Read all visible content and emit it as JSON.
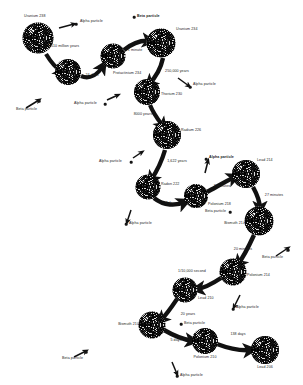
{
  "diagram": {
    "type": "decay-chain",
    "background_color": "#ffffff",
    "ink_color": "#1c1c1c",
    "nodes": [
      {
        "id": "u238",
        "label": "Uranium 238",
        "x": 38,
        "y": 38,
        "r": 15.5,
        "label_x": 24,
        "label_y": 17,
        "label_align": "left"
      },
      {
        "id": "th234",
        "label": "",
        "x": 68,
        "y": 72,
        "r": 13.0,
        "label_x": 68,
        "label_y": 72,
        "label_align": "center"
      },
      {
        "id": "pa234",
        "label": "Protactinium 234",
        "x": 113,
        "y": 56,
        "r": 12.5,
        "label_x": 113,
        "label_y": 74,
        "label_align": "left"
      },
      {
        "id": "u234",
        "label": "Uranium 234",
        "x": 161,
        "y": 43,
        "r": 14.5,
        "label_x": 176,
        "label_y": 30,
        "label_align": "left"
      },
      {
        "id": "th230",
        "label": "Thorium 230",
        "x": 147,
        "y": 92,
        "r": 13.0,
        "label_x": 161,
        "label_y": 95,
        "label_align": "left"
      },
      {
        "id": "ra226",
        "label": "Radium 226",
        "x": 167,
        "y": 135,
        "r": 14.0,
        "label_x": 181,
        "label_y": 131,
        "label_align": "left"
      },
      {
        "id": "rn222",
        "label": "Radon 222",
        "x": 148,
        "y": 187,
        "r": 12.5,
        "label_x": 161,
        "label_y": 185,
        "label_align": "left"
      },
      {
        "id": "po218",
        "label": "Polonium 218",
        "x": 196,
        "y": 196,
        "r": 12.0,
        "label_x": 208,
        "label_y": 205,
        "label_align": "left"
      },
      {
        "id": "pb214",
        "label": "Lead 214",
        "x": 246,
        "y": 174,
        "r": 14.0,
        "label_x": 257,
        "label_y": 161,
        "label_align": "left"
      },
      {
        "id": "bi214",
        "label": "Bismuth 214",
        "x": 259,
        "y": 221,
        "r": 14.5,
        "label_x": 245,
        "label_y": 224,
        "label_align": "right"
      },
      {
        "id": "po214",
        "label": "Polonium 214",
        "x": 233,
        "y": 272,
        "r": 13.5,
        "label_x": 247,
        "label_y": 276,
        "label_align": "left"
      },
      {
        "id": "pb210",
        "label": "Lead 210",
        "x": 185,
        "y": 290,
        "r": 12.5,
        "label_x": 198,
        "label_y": 299,
        "label_align": "left"
      },
      {
        "id": "bi210",
        "label": "Bismuth 210",
        "x": 152,
        "y": 325,
        "r": 13.5,
        "label_x": 139,
        "label_y": 325,
        "label_align": "right"
      },
      {
        "id": "po210",
        "label": "Polonium 210",
        "x": 205,
        "y": 341,
        "r": 13.0,
        "label_x": 205,
        "label_y": 358,
        "label_align": "center"
      },
      {
        "id": "pb206",
        "label": "Lead 206",
        "x": 265,
        "y": 350,
        "r": 14.0,
        "label_x": 265,
        "label_y": 368,
        "label_align": "center"
      }
    ],
    "decays": [
      {
        "from": "u238",
        "to": "th234",
        "half_life": "4510 million years",
        "emits": "Alpha particle",
        "time_x": 64,
        "time_y": 47
      },
      {
        "from": "th234",
        "to": "pa234",
        "half_life": "24 days",
        "emits": "Beta particle",
        "time_x": 92,
        "time_y": 76
      },
      {
        "from": "pa234",
        "to": "u234",
        "half_life": "1 minute",
        "emits": "Beta particle",
        "time_x": 135,
        "time_y": 51
      },
      {
        "from": "u234",
        "to": "th230",
        "half_life": "250,000 years",
        "emits": "Alpha particle",
        "time_x": 177,
        "time_y": 72
      },
      {
        "from": "th230",
        "to": "ra226",
        "half_life": "8000 years",
        "emits": "Alpha particle",
        "time_x": 143,
        "time_y": 115
      },
      {
        "from": "ra226",
        "to": "rn222",
        "half_life": "1,622 years",
        "emits": "Alpha particle",
        "time_x": 177,
        "time_y": 162
      },
      {
        "from": "rn222",
        "to": "po218",
        "half_life": "4 days",
        "emits": "Alpha particle",
        "time_x": 171,
        "time_y": 204
      },
      {
        "from": "po218",
        "to": "pb214",
        "half_life": "3 minutes",
        "emits": "Alpha particle",
        "time_x": 222,
        "time_y": 187
      },
      {
        "from": "pb214",
        "to": "bi214",
        "half_life": "27 minutes",
        "emits": "Beta particle",
        "time_x": 274,
        "time_y": 196
      },
      {
        "from": "bi214",
        "to": "po214",
        "half_life": "20 minutes",
        "emits": "Beta particle",
        "time_x": 243,
        "time_y": 250
      },
      {
        "from": "po214",
        "to": "pb210",
        "half_life": "1/10,000 second",
        "emits": "Alpha particle",
        "time_x": 192,
        "time_y": 272
      },
      {
        "from": "pb210",
        "to": "bi210",
        "half_life": "20 years",
        "emits": "Beta particle",
        "time_x": 188,
        "time_y": 315
      },
      {
        "from": "bi210",
        "to": "po210",
        "half_life": "5 days",
        "emits": "Beta particle",
        "time_x": 176,
        "time_y": 341
      },
      {
        "from": "po210",
        "to": "pb206",
        "half_life": "138 days",
        "emits": "Alpha particle",
        "time_x": 238,
        "time_y": 335
      }
    ],
    "emission_labels": [
      {
        "text": "Alpha particle",
        "bold": false,
        "x": 80,
        "y": 22,
        "align": "left",
        "dot_x": 76,
        "dot_y": 24,
        "tail_x1": 59,
        "tail_y1": 28,
        "tail_x2": 74,
        "tail_y2": 24
      },
      {
        "text": "Beta particle",
        "bold": true,
        "x": 137,
        "y": 17,
        "align": "left",
        "dot_x": 134,
        "dot_y": 17,
        "tail_x1": 134,
        "tail_y1": 17,
        "tail_x2": 134,
        "tail_y2": 17
      },
      {
        "text": "Alpha particle",
        "bold": false,
        "x": 193,
        "y": 85,
        "align": "left",
        "dot_x": 190,
        "dot_y": 87,
        "tail_x1": 178,
        "tail_y1": 78,
        "tail_x2": 189,
        "tail_y2": 86
      },
      {
        "text": "Beta particle",
        "bold": false,
        "x": 16,
        "y": 110,
        "align": "left",
        "dot_x": 39,
        "dot_y": 101,
        "tail_x1": 26,
        "tail_y1": 108,
        "tail_x2": 39,
        "tail_y2": 100
      },
      {
        "text": "Alpha particle",
        "bold": false,
        "x": 74,
        "y": 104,
        "align": "left",
        "dot_x": 105,
        "dot_y": 104,
        "tail_x1": 107,
        "tail_y1": 100,
        "tail_x2": 118,
        "tail_y2": 95
      },
      {
        "text": "Alpha particle",
        "bold": false,
        "x": 99,
        "y": 162,
        "align": "left",
        "dot_x": 131,
        "dot_y": 162,
        "tail_x1": 133,
        "tail_y1": 158,
        "tail_x2": 142,
        "tail_y2": 152
      },
      {
        "text": "Alpha particle",
        "bold": true,
        "x": 209,
        "y": 158,
        "align": "left",
        "dot_x": 206,
        "dot_y": 159,
        "tail_x1": 205,
        "tail_y1": 173,
        "tail_x2": 208,
        "tail_y2": 161
      },
      {
        "text": "Alpha particle",
        "bold": false,
        "x": 129,
        "y": 224,
        "align": "left",
        "dot_x": 126,
        "dot_y": 224,
        "tail_x1": 131,
        "tail_y1": 210,
        "tail_x2": 127,
        "tail_y2": 222
      },
      {
        "text": "Beta particle",
        "bold": false,
        "x": 205,
        "y": 212,
        "align": "left",
        "dot_x": 230,
        "dot_y": 212,
        "tail_x1": 230,
        "tail_y1": 212,
        "tail_x2": 230,
        "tail_y2": 212
      },
      {
        "text": "Beta particle",
        "bold": false,
        "x": 262,
        "y": 258,
        "align": "left",
        "dot_x": 288,
        "dot_y": 250,
        "tail_x1": 276,
        "tail_y1": 256,
        "tail_x2": 288,
        "tail_y2": 248
      },
      {
        "text": "Alpha particle",
        "bold": false,
        "x": 236,
        "y": 308,
        "align": "left",
        "dot_x": 233,
        "dot_y": 309,
        "tail_x1": 240,
        "tail_y1": 295,
        "tail_x2": 234,
        "tail_y2": 307
      },
      {
        "text": "Beta particle",
        "bold": false,
        "x": 62,
        "y": 359,
        "align": "left",
        "dot_x": 86,
        "dot_y": 352,
        "tail_x1": 74,
        "tail_y1": 357,
        "tail_x2": 86,
        "tail_y2": 351
      },
      {
        "text": "Beta particle",
        "bold": false,
        "x": 184,
        "y": 324,
        "align": "left",
        "dot_x": 181,
        "dot_y": 324,
        "tail_x1": 181,
        "tail_y1": 324,
        "tail_x2": 181,
        "tail_y2": 324
      },
      {
        "text": "Alpha particle",
        "bold": false,
        "x": 180,
        "y": 376,
        "align": "left",
        "dot_x": 177,
        "dot_y": 376,
        "tail_x1": 172,
        "tail_y1": 362,
        "tail_x2": 177,
        "tail_y2": 374
      }
    ],
    "arrows": [
      {
        "id": "a-u238-th234",
        "path": "M 46 54 C 52 64 56 68 62 72",
        "width": 4.2
      },
      {
        "id": "a-th234-pa234",
        "path": "M 81 76 C 90 80 98 74 103 66",
        "width": 4.2
      },
      {
        "id": "a-pa234-u234",
        "path": "M 124 50 C 134 42 142 40 150 41",
        "width": 4.4
      },
      {
        "id": "a-u234-th230",
        "path": "M 163 58 C 160 72 153 80 149 84",
        "width": 4.4
      },
      {
        "id": "a-th230-ra226",
        "path": "M 150 105 C 154 115 160 122 163 126",
        "width": 4.2
      },
      {
        "id": "a-ra226-rn222",
        "path": "M 165 150 C 161 164 155 174 151 180",
        "width": 4.4
      },
      {
        "id": "a-rn222-po218",
        "path": "M 154 198 C 164 206 176 206 185 202",
        "width": 4.4
      },
      {
        "id": "a-po218-pb214",
        "path": "M 207 192 C 218 186 228 180 235 177",
        "width": 4.4
      },
      {
        "id": "a-pb214-bi214",
        "path": "M 253 187 C 258 196 260 203 260 209",
        "width": 4.4
      },
      {
        "id": "a-bi214-po214",
        "path": "M 254 235 C 248 248 242 259 238 264",
        "width": 4.4
      },
      {
        "id": "a-po214-pb210",
        "path": "M 221 278 C 212 284 204 288 197 289",
        "width": 4.4
      },
      {
        "id": "a-pb210-bi210",
        "path": "M 177 299 C 171 308 165 316 161 320",
        "width": 4.2
      },
      {
        "id": "a-bi210-po210",
        "path": "M 164 330 C 176 337 186 340 193 341",
        "width": 4.4
      },
      {
        "id": "a-po210-pb206",
        "path": "M 217 344 C 230 349 240 351 251 350",
        "width": 4.4
      }
    ]
  }
}
